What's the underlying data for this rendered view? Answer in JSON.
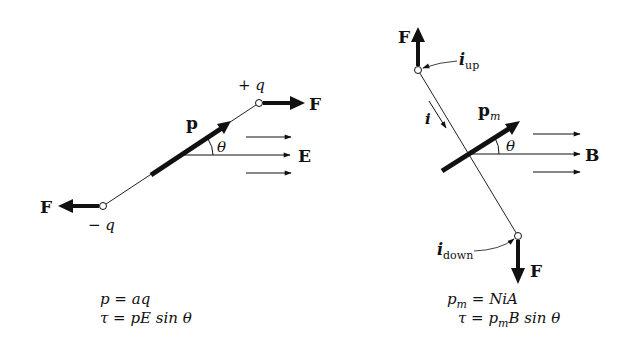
{
  "electric_dipole": {
    "labels": {
      "plus_charge": "+ q",
      "minus_charge": "− q",
      "force_right": "F",
      "force_left": "F",
      "dipole_moment": "p",
      "angle": "θ",
      "field": "E"
    },
    "equations": {
      "line1": "p = aq",
      "line2": "τ = pE sin θ"
    }
  },
  "magnetic_dipole": {
    "labels": {
      "force_up": "F",
      "force_down": "F",
      "current_up_main": "i",
      "current_up_sub": "up",
      "current_down_main": "i",
      "current_down_sub": "down",
      "current": "i",
      "dipole_moment_main": "p",
      "dipole_moment_sub": "m",
      "angle": "θ",
      "field": "B"
    },
    "equations": {
      "line1": "p_m = NiA",
      "line2": "τ = p_m B sin θ",
      "line1_lhs": "p",
      "line1_sub": "m",
      "line1_rhs": " = NiA",
      "line2_lhs": "τ = p",
      "line2_sub": "m",
      "line2_rhs": "B sin θ"
    }
  },
  "colors": {
    "ink": "#111111",
    "background": "#ffffff"
  }
}
